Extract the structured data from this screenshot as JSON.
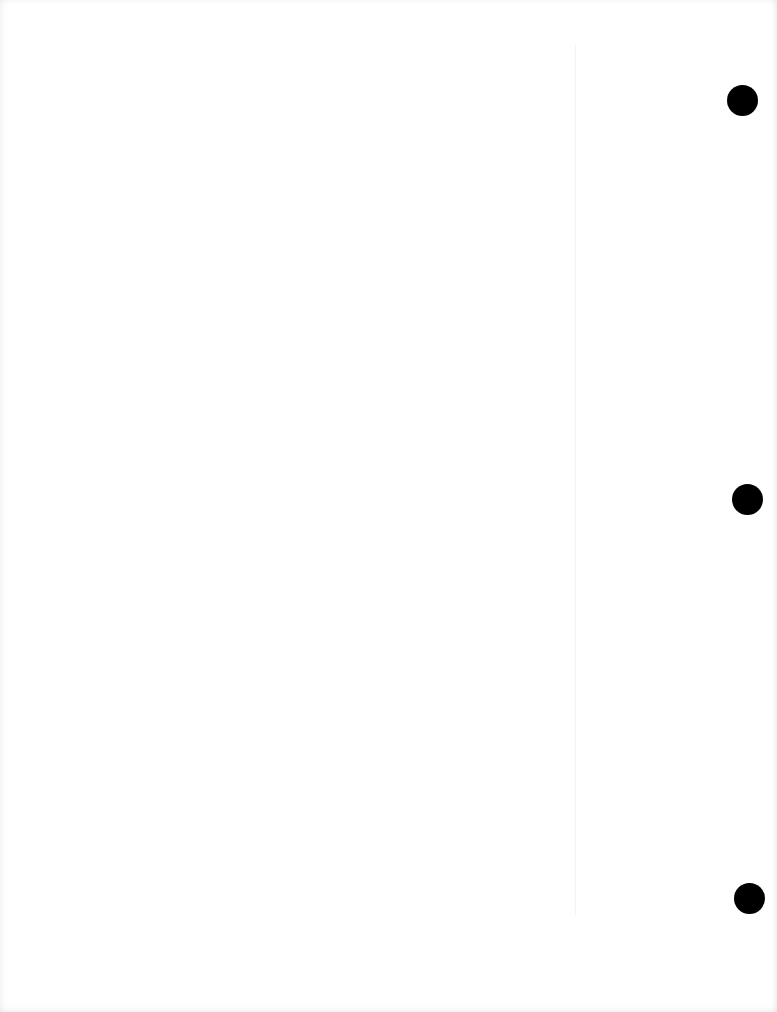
{
  "document": {
    "type": "blank-scanned-page",
    "text": "",
    "punch_holes": 3,
    "colors": {
      "paper": "#ffffff",
      "hole": "#000000"
    }
  }
}
